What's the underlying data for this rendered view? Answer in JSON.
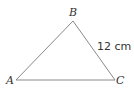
{
  "diagram": {
    "type": "triangle",
    "vertices": [
      {
        "label": "A",
        "x": 16,
        "y": 80
      },
      {
        "label": "B",
        "x": 73,
        "y": 21
      },
      {
        "label": "C",
        "x": 115,
        "y": 80
      }
    ],
    "side_labels": [
      {
        "side": "BC",
        "text": "12 cm"
      }
    ],
    "colors": {
      "stroke": "#8a8a8a",
      "text": "#333333"
    }
  }
}
